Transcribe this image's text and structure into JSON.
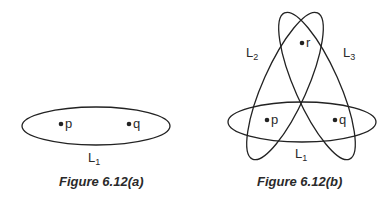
{
  "figures": [
    {
      "caption": "Figure 6.12(a)",
      "points": [
        {
          "name": "p",
          "label": "p"
        },
        {
          "name": "q",
          "label": "q"
        }
      ],
      "lines": [
        {
          "name": "L1",
          "base": "L",
          "sub": "1"
        }
      ]
    },
    {
      "caption": "Figure 6.12(b)",
      "points": [
        {
          "name": "p",
          "label": "p"
        },
        {
          "name": "q",
          "label": "q"
        },
        {
          "name": "r",
          "label": "r"
        }
      ],
      "lines": [
        {
          "name": "L1",
          "base": "L",
          "sub": "1"
        },
        {
          "name": "L2",
          "base": "L",
          "sub": "2"
        },
        {
          "name": "L3",
          "base": "L",
          "sub": "3"
        }
      ]
    }
  ],
  "colors": {
    "stroke": "#222222",
    "background": "#ffffff"
  }
}
